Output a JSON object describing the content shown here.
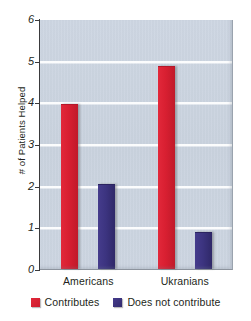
{
  "chart_data": {
    "type": "bar",
    "title": "",
    "subtitle": "",
    "xlabel": "",
    "ylabel": "# of Patients Helped",
    "categories": [
      "Americans",
      "Ukranians"
    ],
    "series": [
      {
        "name": "Contributes",
        "color": "#d81f31",
        "values": [
          3.95,
          4.88
        ]
      },
      {
        "name": "Does not contribute",
        "color": "#3c3480",
        "values": [
          2.05,
          0.9
        ]
      }
    ],
    "ylim": [
      0,
      6
    ],
    "yticks": [
      0,
      1,
      2,
      3,
      4,
      5,
      6
    ],
    "ytick_labels": [
      "0",
      "1",
      "2",
      "3",
      "4",
      "5",
      "6"
    ],
    "grid": true,
    "grid_color": "#ffffff",
    "plot_background": "#ccd5e1",
    "legend_position": "bottom"
  },
  "axis": {
    "y_title": "# of Patients Helped"
  },
  "legend": {
    "entries": [
      {
        "label": "Contributes",
        "swatch": "red-square-swatch"
      },
      {
        "label": "Does not contribute",
        "swatch": "blue-square-swatch"
      }
    ]
  }
}
